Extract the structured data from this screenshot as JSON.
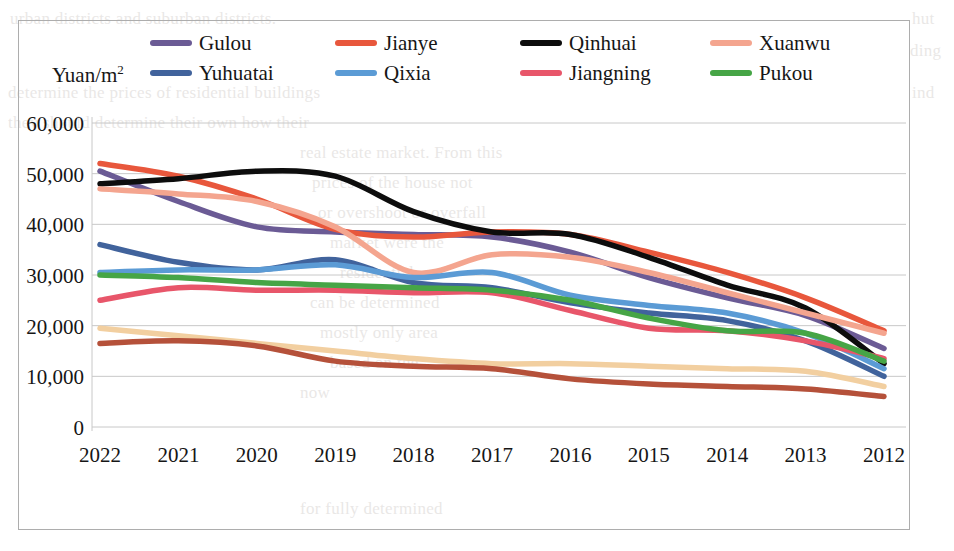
{
  "axis_title": {
    "text": "Yuan/m",
    "superscript": "2"
  },
  "legend": {
    "items": [
      {
        "label": "Gulou",
        "color": "#6b5b95"
      },
      {
        "label": "Jianye",
        "color": "#e8573c"
      },
      {
        "label": "Qinhuai",
        "color": "#0d0d0d"
      },
      {
        "label": "Xuanwu",
        "color": "#f4a58f"
      },
      {
        "label": "Yuhuatai",
        "color": "#41639c"
      },
      {
        "label": "Qixia",
        "color": "#5b9bd5"
      },
      {
        "label": "Jiangning",
        "color": "#e8566a"
      },
      {
        "label": "Pukou",
        "color": "#46a546"
      }
    ]
  },
  "chart_data": {
    "type": "line",
    "title": "",
    "xlabel": "",
    "ylabel": "Yuan/m2",
    "ylim": [
      0,
      60000
    ],
    "ytick_step": 10000,
    "ytick_labels": [
      "60,000",
      "50,000",
      "40,000",
      "30,000",
      "20,000",
      "10,000",
      "0"
    ],
    "yticks": [
      60000,
      50000,
      40000,
      30000,
      20000,
      10000,
      0
    ],
    "grid": true,
    "legend_position": "top",
    "categories": [
      "2022",
      "2021",
      "2020",
      "2019",
      "2018",
      "2017",
      "2016",
      "2015",
      "2014",
      "2013",
      "2012"
    ],
    "series": [
      {
        "name": "Gulou",
        "color": "#6b5b95",
        "values": [
          50500,
          44500,
          39500,
          38500,
          38000,
          37500,
          34500,
          29500,
          25500,
          22000,
          15500
        ]
      },
      {
        "name": "Jianye",
        "color": "#e8573c",
        "values": [
          52000,
          49500,
          45000,
          39000,
          37500,
          38500,
          38000,
          34500,
          30500,
          25500,
          19000
        ]
      },
      {
        "name": "Qinhuai",
        "color": "#0d0d0d",
        "values": [
          48000,
          49000,
          50500,
          49500,
          42500,
          38500,
          38000,
          33500,
          28000,
          23500,
          12500
        ]
      },
      {
        "name": "Xuanwu",
        "color": "#f4a58f",
        "values": [
          47000,
          46000,
          44500,
          39500,
          30500,
          34000,
          33500,
          30500,
          26500,
          22500,
          18500
        ]
      },
      {
        "name": "Yuhuatai",
        "color": "#41639c",
        "values": [
          36000,
          32500,
          31000,
          33000,
          28500,
          27500,
          24500,
          22500,
          21000,
          17000,
          10000
        ]
      },
      {
        "name": "Qixia",
        "color": "#5b9bd5",
        "values": [
          30500,
          31000,
          31000,
          32000,
          29500,
          30500,
          26000,
          24000,
          22500,
          18500,
          11500
        ]
      },
      {
        "name": "Jiangning",
        "color": "#e8566a",
        "values": [
          25000,
          27500,
          27000,
          27000,
          26500,
          26500,
          23000,
          19500,
          19000,
          17000,
          13500
        ]
      },
      {
        "name": "Pukou",
        "color": "#46a546",
        "values": [
          30000,
          29500,
          28500,
          28000,
          27500,
          27000,
          25000,
          21500,
          19000,
          18500,
          13000
        ]
      },
      {
        "name": "Series-9",
        "color": "#f2cfa0",
        "values": [
          19500,
          18000,
          16500,
          15000,
          13500,
          12500,
          12500,
          12000,
          11500,
          11000,
          8000
        ]
      },
      {
        "name": "Series-10",
        "color": "#b5513a",
        "values": [
          16500,
          17000,
          16000,
          13000,
          12000,
          11500,
          9500,
          8500,
          8000,
          7500,
          6000
        ]
      }
    ]
  },
  "page_bleed": {
    "lines": [
      {
        "text": "urban districts and suburban districts.",
        "x": 10,
        "y": 4
      },
      {
        "text": "hut",
        "x": 912,
        "y": 4
      },
      {
        "text": "ding",
        "x": 910,
        "y": 36
      },
      {
        "text": "determine the prices of residential buildings",
        "x": 8,
        "y": 78
      },
      {
        "text": "ind",
        "x": 912,
        "y": 78
      },
      {
        "text": "they should determine their own how their",
        "x": 8,
        "y": 108
      },
      {
        "text": "real estate market. From this",
        "x": 300,
        "y": 138
      },
      {
        "text": "prices of the house not",
        "x": 312,
        "y": 168
      },
      {
        "text": "or overshoot or overfall",
        "x": 318,
        "y": 198
      },
      {
        "text": "market were the",
        "x": 330,
        "y": 228
      },
      {
        "text": "residential",
        "x": 340,
        "y": 258
      },
      {
        "text": "can be determined",
        "x": 310,
        "y": 288
      },
      {
        "text": "mostly only area",
        "x": 320,
        "y": 318
      },
      {
        "text": "based on the",
        "x": 330,
        "y": 348
      },
      {
        "text": "now",
        "x": 300,
        "y": 378
      },
      {
        "text": "for fully determined",
        "x": 300,
        "y": 494
      }
    ]
  }
}
